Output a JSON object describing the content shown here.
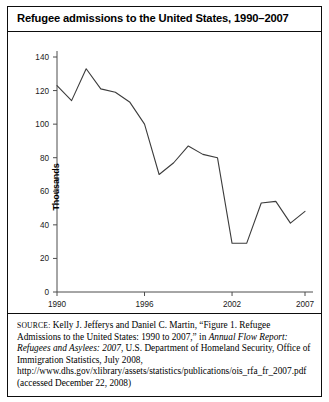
{
  "figure": {
    "title": "Refugee admissions to the United States, 1990–2007",
    "y_axis_title": "Thousands"
  },
  "source": {
    "label": "SOURCE:",
    "text_part1": " Kelly J. Jefferys and Daniel C. Martin, “Figure 1. Refugee Admissions to the United States: 1990 to 2007,” in ",
    "italic1": "Annual Flow Report: Refugees and Asylees: 2007",
    "text_part2": ", U.S. Department of Homeland Security, Office of Immigration Statistics, July 2008, http://www.dhs.gov/xlibrary/assets/statistics/publications/ois_rfa_fr_2007.pdf (accessed December 22, 2008)"
  },
  "chart_data": {
    "type": "line",
    "title": "Refugee admissions to the United States, 1990–2007",
    "xlabel": "",
    "ylabel": "Thousands",
    "xlim": [
      1990,
      2007
    ],
    "ylim": [
      0,
      140
    ],
    "ytick_values": [
      0,
      20,
      40,
      60,
      80,
      100,
      120,
      140
    ],
    "ytick_labels": [
      "0",
      "20",
      "40",
      "60",
      "80",
      "100",
      "120",
      "140"
    ],
    "xtick_values": [
      1990,
      1996,
      2002,
      2007
    ],
    "xtick_labels": [
      "1990",
      "1996",
      "2002",
      "2007"
    ],
    "grid": false,
    "legend": false,
    "line_color": "#3c3c3c",
    "x": [
      1990,
      1991,
      1992,
      1993,
      1994,
      1995,
      1996,
      1997,
      1998,
      1999,
      2000,
      2001,
      2002,
      2003,
      2004,
      2005,
      2006,
      2007
    ],
    "values": [
      123,
      114,
      133,
      121,
      119,
      113,
      100,
      70,
      77,
      87,
      82,
      80,
      29,
      29,
      53,
      54,
      41,
      48
    ],
    "series": [
      {
        "name": "Refugee admissions",
        "values": [
          123,
          114,
          133,
          121,
          119,
          113,
          100,
          70,
          77,
          87,
          82,
          80,
          29,
          29,
          53,
          54,
          41,
          48
        ]
      }
    ]
  }
}
